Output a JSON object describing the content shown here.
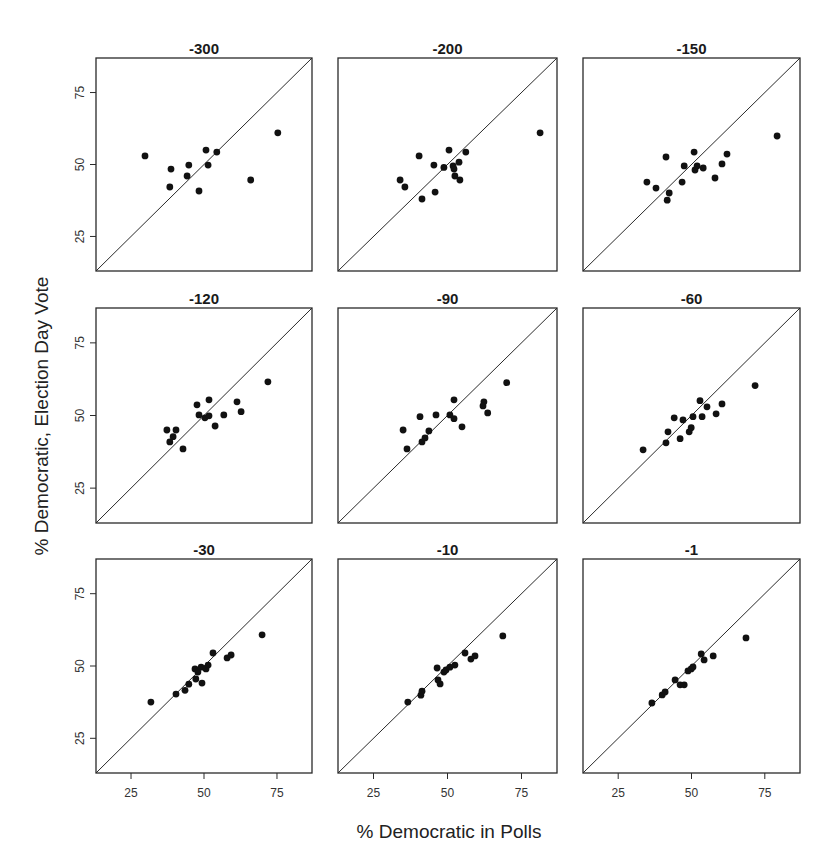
{
  "chart_data": {
    "type": "scatter",
    "layout": "3x3 small multiples",
    "xlabel": "% Democratic in Polls",
    "ylabel": "% Democratic, Election Day Vote",
    "xlim": [
      13,
      87
    ],
    "ylim": [
      13,
      87
    ],
    "xticks": [
      25,
      50,
      75
    ],
    "yticks": [
      25,
      50,
      75
    ],
    "grid": false,
    "reference_line": "y = x",
    "panels": [
      {
        "title": "-300",
        "points": [
          [
            29.8,
            53
          ],
          [
            38.7,
            48.4
          ],
          [
            38.3,
            42.2
          ],
          [
            44.8,
            49.8
          ],
          [
            44.2,
            46
          ],
          [
            50.7,
            55
          ],
          [
            51.4,
            49.8
          ],
          [
            54.4,
            54.3
          ],
          [
            48.3,
            40.8
          ],
          [
            66,
            44.6
          ],
          [
            75.3,
            61
          ]
        ]
      },
      {
        "title": "-200",
        "points": [
          [
            34,
            44.6
          ],
          [
            35.6,
            42.2
          ],
          [
            40.4,
            53
          ],
          [
            41.4,
            38
          ],
          [
            45.4,
            49.8
          ],
          [
            45.8,
            40.4
          ],
          [
            48.8,
            49
          ],
          [
            50.5,
            55
          ],
          [
            51.9,
            49.5
          ],
          [
            52.2,
            48.4
          ],
          [
            53.9,
            50.8
          ],
          [
            52.5,
            46
          ],
          [
            54.2,
            44.6
          ],
          [
            56.2,
            54.3
          ],
          [
            81.3,
            61
          ]
        ]
      },
      {
        "title": "-150",
        "points": [
          [
            34.8,
            43.9
          ],
          [
            37.9,
            41.8
          ],
          [
            41.3,
            52.6
          ],
          [
            41.7,
            37.6
          ],
          [
            42.4,
            40.1
          ],
          [
            46.8,
            43.9
          ],
          [
            47.5,
            49.5
          ],
          [
            50.9,
            54.3
          ],
          [
            51.2,
            48.1
          ],
          [
            51.9,
            49.5
          ],
          [
            54,
            48.8
          ],
          [
            58,
            45.3
          ],
          [
            60.4,
            50.2
          ],
          [
            62.1,
            53.6
          ],
          [
            79.2,
            59.9
          ]
        ]
      },
      {
        "title": "-120",
        "points": [
          [
            37.3,
            45
          ],
          [
            40.4,
            45
          ],
          [
            39.4,
            42.7
          ],
          [
            38.3,
            40.9
          ],
          [
            42.8,
            38.5
          ],
          [
            47.6,
            53.7
          ],
          [
            48.3,
            50.2
          ],
          [
            50.3,
            49.2
          ],
          [
            51.7,
            49.9
          ],
          [
            51.7,
            55.4
          ],
          [
            53.8,
            46.4
          ],
          [
            56.8,
            50.2
          ],
          [
            61.3,
            54.7
          ],
          [
            62.7,
            51.3
          ],
          [
            71.9,
            61.6
          ]
        ]
      },
      {
        "title": "-90",
        "points": [
          [
            35,
            45
          ],
          [
            36.3,
            38.5
          ],
          [
            40.7,
            49.6
          ],
          [
            41.4,
            40.9
          ],
          [
            42.4,
            42.3
          ],
          [
            43.7,
            44.7
          ],
          [
            46.1,
            50.2
          ],
          [
            50.8,
            50.2
          ],
          [
            52.2,
            55.4
          ],
          [
            52.2,
            48.9
          ],
          [
            54.9,
            46.1
          ],
          [
            62.3,
            54.7
          ],
          [
            62,
            53.3
          ],
          [
            63.6,
            50.9
          ],
          [
            70,
            61.3
          ]
        ]
      },
      {
        "title": "-60",
        "points": [
          [
            33.5,
            38.2
          ],
          [
            41.3,
            40.6
          ],
          [
            42,
            44.4
          ],
          [
            44.1,
            49.2
          ],
          [
            46.1,
            42
          ],
          [
            47.1,
            48.5
          ],
          [
            49.2,
            44.4
          ],
          [
            49.9,
            45.8
          ],
          [
            50.5,
            49.6
          ],
          [
            52.9,
            55.1
          ],
          [
            53.6,
            49.6
          ],
          [
            55.3,
            53
          ],
          [
            58.4,
            50.6
          ],
          [
            60.4,
            54
          ],
          [
            71.7,
            60.3
          ]
        ]
      },
      {
        "title": "-30",
        "points": [
          [
            31.8,
            37.5
          ],
          [
            40.4,
            40.3
          ],
          [
            43.5,
            41.6
          ],
          [
            44.8,
            43.7
          ],
          [
            47.2,
            45.5
          ],
          [
            49.3,
            44.1
          ],
          [
            46.9,
            49
          ],
          [
            47.9,
            47.9
          ],
          [
            49,
            49.6
          ],
          [
            50.7,
            49
          ],
          [
            51.4,
            50.3
          ],
          [
            53.1,
            54.5
          ],
          [
            57.9,
            52.8
          ],
          [
            59.3,
            53.8
          ],
          [
            69.9,
            60.8
          ]
        ]
      },
      {
        "title": "-10",
        "points": [
          [
            36.6,
            37.5
          ],
          [
            41,
            39.9
          ],
          [
            41.4,
            41.3
          ],
          [
            46.5,
            49.3
          ],
          [
            46.8,
            45.2
          ],
          [
            47.5,
            43.8
          ],
          [
            48.8,
            47.9
          ],
          [
            49.5,
            48.6
          ],
          [
            50.8,
            49.6
          ],
          [
            52.5,
            50.3
          ],
          [
            55.9,
            54.5
          ],
          [
            57.9,
            52.4
          ],
          [
            59.3,
            53.5
          ],
          [
            68.7,
            60.4
          ]
        ]
      },
      {
        "title": "-1",
        "points": [
          [
            36.5,
            37.2
          ],
          [
            40,
            40
          ],
          [
            41,
            41
          ],
          [
            44.4,
            45.2
          ],
          [
            46.1,
            43.5
          ],
          [
            47.5,
            43.5
          ],
          [
            48.8,
            48.3
          ],
          [
            49.9,
            49
          ],
          [
            50.5,
            49.7
          ],
          [
            53.3,
            54.2
          ],
          [
            54.3,
            52.1
          ],
          [
            57.4,
            53.5
          ],
          [
            68.6,
            59.7
          ]
        ]
      }
    ]
  },
  "figure": {
    "xlabel": "% Democratic in Polls",
    "ylabel": "% Democratic, Election Day Vote",
    "tick_labels": [
      "25",
      "50",
      "75"
    ]
  }
}
